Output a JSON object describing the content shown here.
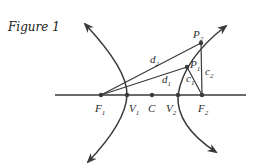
{
  "figure": {
    "title": "Figure 1",
    "colors": {
      "ink": "#3a3a3a",
      "background": "#ffffff"
    },
    "points": {
      "F1": {
        "label": "F",
        "sub": "1"
      },
      "V1": {
        "label": "V",
        "sub": "1"
      },
      "C": {
        "label": "C"
      },
      "V2": {
        "label": "V",
        "sub": "2"
      },
      "F2": {
        "label": "F",
        "sub": "2"
      },
      "P1": {
        "label": "P",
        "sub": "1"
      },
      "P2": {
        "label": "P",
        "sub": "2"
      }
    },
    "segments": {
      "d1": {
        "label": "d",
        "sub": "1"
      },
      "d2": {
        "label": "d",
        "sub": "2"
      },
      "c1": {
        "label": "c",
        "sub": "1"
      },
      "c2": {
        "label": "c",
        "sub": "2"
      }
    }
  }
}
